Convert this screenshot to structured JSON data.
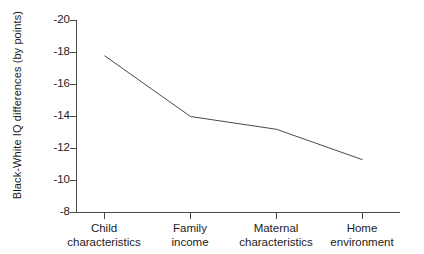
{
  "chart_data": {
    "type": "line",
    "title": "",
    "xlabel": "",
    "ylabel": "Black-White IQ differences (by points)",
    "categories": [
      "Child\ncharacteristics",
      "Family\nincome",
      "Maternal\ncharacteristics",
      "Home\nenvironment"
    ],
    "category_lines": [
      [
        "Child",
        "characteristics"
      ],
      [
        "Family",
        "income"
      ],
      [
        "Maternal",
        "characteristics"
      ],
      [
        "Home",
        "environment"
      ]
    ],
    "values": [
      -17.8,
      -14.0,
      -13.2,
      -11.3
    ],
    "ylim": [
      -8,
      -20
    ],
    "y_ticks": [
      -20,
      -18,
      -16,
      -14,
      -12,
      -10,
      -8
    ],
    "y_tick_labels": [
      "-20",
      "-18",
      "-16",
      "-14",
      "-12",
      "-10",
      "-8"
    ],
    "grid": false,
    "legend": null,
    "series": [
      {
        "name": "Black-White IQ difference",
        "values": [
          -17.8,
          -14.0,
          -13.2,
          -11.3
        ],
        "color": "#4a4a4a"
      }
    ],
    "line_color": "#4a4a4a",
    "axis_color": "#4a4a4a"
  }
}
